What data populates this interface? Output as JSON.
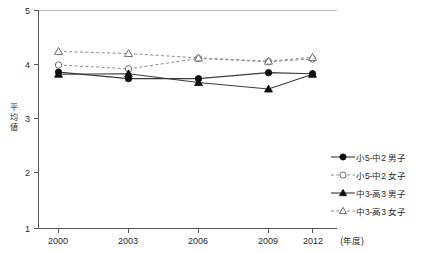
{
  "chart_data": {
    "type": "line",
    "title": "",
    "subtitle": "",
    "xlabel": "(年度)",
    "ylabel": "平均値",
    "categories": [
      "2000",
      "2003",
      "2006",
      "2009",
      "2012"
    ],
    "x": [
      2000,
      2003,
      2006,
      2009,
      2012
    ],
    "xlim": [
      2000,
      2012
    ],
    "ylim": [
      1,
      5
    ],
    "yticks": [
      "1",
      "2",
      "3",
      "4",
      "5"
    ],
    "grid": false,
    "legend_position": "right",
    "series": [
      {
        "name": "小5-中2 男子",
        "marker": "filled-circle",
        "line": "solid",
        "values": [
          3.87,
          3.75,
          3.75,
          3.86,
          3.84
        ]
      },
      {
        "name": "小5-中2 女子",
        "marker": "open-circle",
        "line": "dashed",
        "values": [
          4.0,
          3.93,
          4.12,
          4.06,
          4.11
        ]
      },
      {
        "name": "中3-高3 男子",
        "marker": "filled-triangle",
        "line": "solid",
        "values": [
          3.83,
          3.84,
          3.68,
          3.56,
          3.83
        ]
      },
      {
        "name": "中3-高3 女子",
        "marker": "open-triangle",
        "line": "dashed",
        "values": [
          4.25,
          4.21,
          4.13,
          4.07,
          4.14
        ]
      }
    ]
  },
  "axes": {
    "y_axis_label": "平均値",
    "y_axis_label_chars": [
      "平",
      "均",
      "値"
    ],
    "x_axis_unit": "(年度)",
    "y_tick_labels": [
      "5",
      "4",
      "3",
      "2",
      "1"
    ],
    "x_tick_labels": [
      "2000",
      "2003",
      "2006",
      "2009",
      "2012"
    ]
  },
  "legend": {
    "items": [
      {
        "label": "小5-中2 男子",
        "marker": "filled-circle",
        "line": "solid"
      },
      {
        "label": "小5-中2 女子",
        "marker": "open-circle",
        "line": "dashed"
      },
      {
        "label": "中3-高3 男子",
        "marker": "filled-triangle",
        "line": "solid"
      },
      {
        "label": "中3-高3 女子",
        "marker": "open-triangle",
        "line": "dashed"
      }
    ]
  },
  "colors": {
    "solid_line": "#3a3a3a",
    "dashed_line": "#8a8a8a",
    "axis": "#555555",
    "top_rule": "#bfbfbf",
    "marker_fill": "#0d0d0d",
    "marker_open_fill": "#ffffff",
    "text": "#1f1f1f",
    "background": "#ffffff"
  }
}
